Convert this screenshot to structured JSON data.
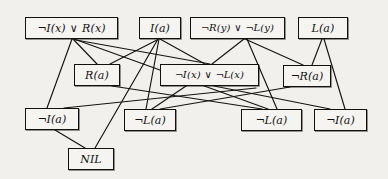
{
  "diagram": {
    "type": "resolution-proof-graph",
    "canvas": {
      "width": 388,
      "height": 179
    },
    "style": {
      "background_color": "#f2f0ec",
      "box_fill_color": "#f6f4f1",
      "box_border_color": "#111111",
      "edge_color": "#131313",
      "text_color": "#101010"
    },
    "nodes": [
      {
        "id": "n1",
        "label": "¬I(x) ∨ R(x)",
        "row": "top",
        "x": 25,
        "y": 17,
        "w": 93,
        "h": 22,
        "font_size": 11
      },
      {
        "id": "n2",
        "label": "I(a)",
        "row": "top",
        "x": 139,
        "y": 17,
        "w": 42,
        "h": 22,
        "font_size": 11
      },
      {
        "id": "n3",
        "label": "¬R(y) ∨ ¬L(y)",
        "row": "top",
        "x": 190,
        "y": 17,
        "w": 95,
        "h": 22,
        "font_size": 10
      },
      {
        "id": "n4",
        "label": "L(a)",
        "row": "top",
        "x": 298,
        "y": 17,
        "w": 50,
        "h": 22,
        "font_size": 11
      },
      {
        "id": "n5",
        "label": "R(a)",
        "row": "middle",
        "x": 74,
        "y": 64,
        "w": 46,
        "h": 22,
        "font_size": 11
      },
      {
        "id": "n6",
        "label": "¬I(x) ∨ ¬L(x)",
        "row": "middle",
        "x": 160,
        "y": 64,
        "w": 99,
        "h": 22,
        "font_size": 10
      },
      {
        "id": "n7",
        "label": "¬R(a)",
        "row": "middle",
        "x": 283,
        "y": 65,
        "w": 48,
        "h": 22,
        "font_size": 11
      },
      {
        "id": "n8",
        "label": "¬I(a)",
        "row": "bottom",
        "x": 25,
        "y": 108,
        "w": 54,
        "h": 22,
        "font_size": 11
      },
      {
        "id": "n9",
        "label": "¬L(a)",
        "row": "bottom",
        "x": 124,
        "y": 109,
        "w": 52,
        "h": 22,
        "font_size": 11
      },
      {
        "id": "n10",
        "label": "¬L(a)",
        "row": "bottom",
        "x": 241,
        "y": 109,
        "w": 61,
        "h": 22,
        "font_size": 11
      },
      {
        "id": "n11",
        "label": "¬I(a)",
        "row": "bottom",
        "x": 314,
        "y": 109,
        "w": 53,
        "h": 22,
        "font_size": 11
      },
      {
        "id": "n12",
        "label": "NIL",
        "row": "nil",
        "x": 68,
        "y": 148,
        "w": 46,
        "h": 22,
        "font_size": 11
      }
    ],
    "edges": [
      {
        "from": "n1",
        "to": "n8",
        "x1": 72,
        "y1": 39,
        "x2": 47,
        "y2": 108
      },
      {
        "from": "n1",
        "to": "n5",
        "x1": 73,
        "y1": 39,
        "x2": 97,
        "y2": 64
      },
      {
        "from": "n1",
        "to": "n10",
        "x1": 74,
        "y1": 39,
        "x2": 268,
        "y2": 109
      },
      {
        "from": "n1",
        "to": "n6",
        "x1": 76,
        "y1": 40,
        "x2": 210,
        "y2": 64
      },
      {
        "from": "n2",
        "to": "n6",
        "x1": 160,
        "y1": 39,
        "x2": 205,
        "y2": 64
      },
      {
        "from": "n2",
        "to": "n9",
        "x1": 159,
        "y1": 39,
        "x2": 146,
        "y2": 109
      },
      {
        "from": "n2",
        "to": "n12",
        "x1": 158,
        "y1": 39,
        "x2": 95,
        "y2": 148
      },
      {
        "from": "n2",
        "to": "n5",
        "x1": 157,
        "y1": 40,
        "x2": 110,
        "y2": 64
      },
      {
        "from": "n3",
        "to": "n7",
        "x1": 245,
        "y1": 39,
        "x2": 303,
        "y2": 65
      },
      {
        "from": "n3",
        "to": "n6",
        "x1": 244,
        "y1": 39,
        "x2": 212,
        "y2": 64
      },
      {
        "from": "n3",
        "to": "n10",
        "x1": 247,
        "y1": 39,
        "x2": 277,
        "y2": 109
      },
      {
        "from": "n4",
        "to": "n7",
        "x1": 322,
        "y1": 39,
        "x2": 312,
        "y2": 65
      },
      {
        "from": "n4",
        "to": "n11",
        "x1": 324,
        "y1": 39,
        "x2": 345,
        "y2": 109
      },
      {
        "from": "n5",
        "to": "n10",
        "x1": 112,
        "y1": 86,
        "x2": 262,
        "y2": 109
      },
      {
        "from": "n6",
        "to": "n9",
        "x1": 186,
        "y1": 86,
        "x2": 152,
        "y2": 109
      },
      {
        "from": "n6",
        "to": "n11",
        "x1": 214,
        "y1": 86,
        "x2": 330,
        "y2": 109
      },
      {
        "from": "n7",
        "to": "n9",
        "x1": 290,
        "y1": 87,
        "x2": 160,
        "y2": 109
      },
      {
        "from": "n8",
        "to": "n12",
        "x1": 55,
        "y1": 130,
        "x2": 85,
        "y2": 148
      },
      {
        "from": "n8",
        "to": "n6",
        "x1": 64,
        "y1": 108,
        "x2": 256,
        "y2": 88
      }
    ]
  }
}
